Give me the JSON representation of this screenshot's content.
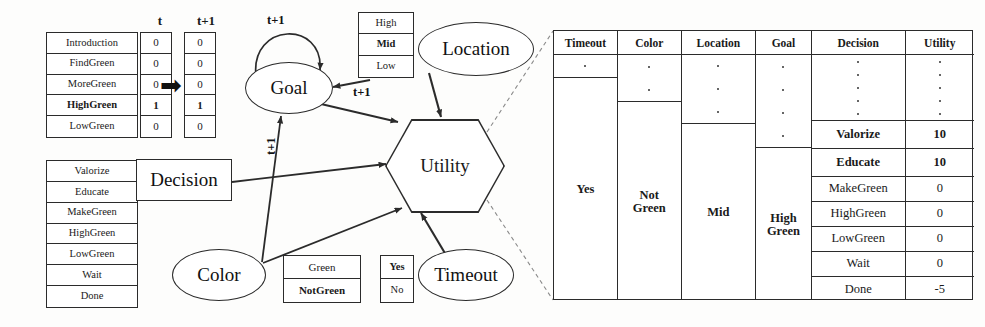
{
  "goal_state": {
    "col_headers": [
      "t",
      "t+1"
    ],
    "rows": [
      {
        "label": "Introduction",
        "t": "0",
        "t1": "0",
        "selected": false
      },
      {
        "label": "FindGreen",
        "t": "0",
        "t1": "0",
        "selected": false
      },
      {
        "label": "MoreGreen",
        "t": "0",
        "t1": "0",
        "selected": false
      },
      {
        "label": "HighGreen",
        "t": "1",
        "t1": "1",
        "selected": true
      },
      {
        "label": "LowGreen",
        "t": "0",
        "t1": "0",
        "selected": false
      }
    ],
    "transition_arrow": "➡"
  },
  "decision_options": {
    "items": [
      {
        "label": "Valorize",
        "selected": false
      },
      {
        "label": "Educate",
        "selected": false
      },
      {
        "label": "MakeGreen",
        "selected": false
      },
      {
        "label": "HighGreen",
        "selected": false
      },
      {
        "label": "LowGreen",
        "selected": false
      },
      {
        "label": "Wait",
        "selected": false
      },
      {
        "label": "Done",
        "selected": false
      }
    ]
  },
  "location_values": {
    "items": [
      {
        "label": "High",
        "selected": false
      },
      {
        "label": "Mid",
        "selected": true
      },
      {
        "label": "Low",
        "selected": false
      }
    ]
  },
  "color_values": {
    "items": [
      {
        "label": "Green",
        "selected": false
      },
      {
        "label": "NotGreen",
        "selected": true
      }
    ]
  },
  "timeout_values": {
    "items": [
      {
        "label": "Yes",
        "selected": true
      },
      {
        "label": "No",
        "selected": false
      }
    ]
  },
  "nodes": {
    "goal": "Goal",
    "location": "Location",
    "decision": "Decision",
    "color": "Color",
    "timeout": "Timeout",
    "utility": "Utility"
  },
  "edge_labels": {
    "goal_self": "t+1",
    "location_to_goal": "t+1",
    "color_to_goal": "t+1"
  },
  "utility_table": {
    "headers": [
      "Timeout",
      "Color",
      "Location",
      "Goal",
      "Decision",
      "Utility"
    ],
    "timeout_value": "Yes",
    "color_value": "Not Green",
    "location_value": "Mid",
    "goal_value": "High Green",
    "decision_rows": [
      {
        "decision": "Valorize",
        "utility": "10",
        "bold": true
      },
      {
        "decision": "Educate",
        "utility": "10",
        "bold": true
      },
      {
        "decision": "MakeGreen",
        "utility": "0",
        "bold": false
      },
      {
        "decision": "HighGreen",
        "utility": "0",
        "bold": false
      },
      {
        "decision": "LowGreen",
        "utility": "0",
        "bold": false
      },
      {
        "decision": "Wait",
        "utility": "0",
        "bold": false
      },
      {
        "decision": "Done",
        "utility": "-5",
        "bold": false
      }
    ],
    "ellipsis_counts": {
      "timeout": 1,
      "color": 2,
      "location": 3,
      "goal": 4,
      "decision": 5,
      "utility": 5
    }
  },
  "colors": {
    "line": "#2b2b2b",
    "background": "#fdfdfc",
    "text": "#1a1a1a"
  }
}
